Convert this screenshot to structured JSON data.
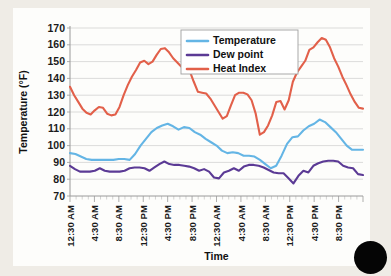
{
  "slide": {
    "background_color": "#efece6",
    "panel_color": "#fdfdfb",
    "artifact_name": "black-dot-overlay",
    "artifact_color": "#050505"
  },
  "chart_data": {
    "type": "line",
    "title": "",
    "xlabel": "Time",
    "ylabel": "Temperature (°F)",
    "ylim": [
      70,
      170
    ],
    "ytick_step": 10,
    "yticks": [
      70,
      80,
      90,
      100,
      110,
      120,
      130,
      140,
      150,
      160,
      170
    ],
    "grid": true,
    "grid_axis": "y",
    "legend_position": "top-center-right",
    "x_tick_labels": [
      "12:30 AM",
      "4:30 AM",
      "8:30 AM",
      "12:30 PM",
      "4:30 PM",
      "8:30 PM",
      "12:30 AM",
      "4:30 AM",
      "8:30 AM",
      "12:30 PM",
      "4:30 PM",
      "8:30 PM"
    ],
    "x_major_interval_hours": 4,
    "x_minor_interval_hours": 1,
    "x_points_count": 48,
    "series": [
      {
        "name": "Temperature",
        "color": "#64b5e5",
        "values": [
          95.5,
          95,
          93.5,
          92,
          91.5,
          91.5,
          91.5,
          91.5,
          91.5,
          92,
          92,
          91.5,
          95,
          100,
          104,
          108,
          110.5,
          112,
          113,
          111.5,
          109.5,
          111,
          110.5,
          108,
          106.5,
          104,
          102,
          100,
          97,
          95.5,
          96,
          95.5,
          94,
          94,
          93.5,
          91.5,
          89,
          86.5,
          88,
          94,
          101,
          105,
          105.5,
          109,
          111.5,
          113,
          115.5,
          114,
          111,
          108,
          104,
          100,
          97.5,
          97.5,
          97.5
        ]
      },
      {
        "name": "Dew point",
        "color": "#5b3a95",
        "values": [
          88,
          86,
          84.5,
          84.5,
          84.5,
          85,
          86.5,
          85,
          84.5,
          84.5,
          84.5,
          85,
          86.5,
          87,
          87,
          86.5,
          85,
          87,
          89,
          90.5,
          89,
          88.5,
          88.5,
          88,
          87.5,
          86.5,
          85,
          86,
          84.5,
          81,
          80.5,
          84,
          85,
          86.5,
          85,
          87.5,
          88.5,
          88.5,
          88,
          87,
          85.5,
          84,
          83.5,
          83.5,
          80.5,
          77.5,
          82,
          85,
          84,
          88,
          89.5,
          90.5,
          91,
          91,
          90.5,
          88,
          87,
          86.5,
          83,
          82.5
        ]
      },
      {
        "name": "Heat Index",
        "color": "#e2604a",
        "values": [
          135,
          130,
          126,
          122,
          119.5,
          118.5,
          121,
          123,
          122.5,
          119,
          118,
          118.5,
          123,
          130,
          136,
          141,
          145,
          149.5,
          150.5,
          148.5,
          150,
          154,
          157.5,
          158,
          155.5,
          152,
          149.5,
          147,
          145,
          144.5,
          138,
          132,
          131.5,
          131,
          128,
          124,
          120,
          116,
          117.5,
          124,
          130,
          131.5,
          131.5,
          130.5,
          127,
          119,
          106.5,
          108,
          112,
          118,
          126,
          126.5,
          121.5,
          127,
          138,
          143.5,
          147,
          150.5,
          157,
          158.5,
          161.5,
          164,
          163,
          158.5,
          152,
          147,
          141,
          136,
          130.5,
          126,
          122.5,
          122
        ]
      }
    ]
  },
  "legend": {
    "items": [
      {
        "label": "Temperature",
        "color": "#64b5e5"
      },
      {
        "label": "Dew point",
        "color": "#5b3a95"
      },
      {
        "label": "Heat Index",
        "color": "#e2604a"
      }
    ]
  }
}
